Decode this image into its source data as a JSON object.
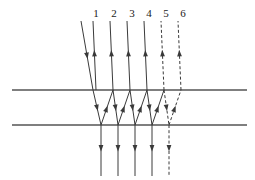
{
  "figure": {
    "title": "",
    "type": "optical-ray-diagram",
    "width": 255,
    "height": 180,
    "background": "#ffffff",
    "ink_color": "#3a3a3a",
    "label_color": "#1a1a1a",
    "line_width": 1.0
  },
  "surfaces": {
    "name": "plane-parallel-plate",
    "stroke": "#555555",
    "stroke_width": 1.6,
    "x_start": 12,
    "x_end": 247,
    "top_y": 90,
    "bottom_y": 125
  },
  "labels": {
    "items": [
      {
        "text": "1",
        "x": 96,
        "y": 17
      },
      {
        "text": "2",
        "x": 114,
        "y": 17
      },
      {
        "text": "3",
        "x": 132,
        "y": 17
      },
      {
        "text": "4",
        "x": 149,
        "y": 17
      },
      {
        "text": "5",
        "x": 166,
        "y": 17
      },
      {
        "text": "6",
        "x": 183,
        "y": 17
      }
    ]
  },
  "incident_ray": {
    "name": "incident-ray",
    "x1": 81,
    "y1": 21,
    "x2": 93,
    "y2": 90,
    "dashed": false,
    "arrow_t": 0.55,
    "direction": "down"
  },
  "reflected_rays": [
    {
      "label": "1",
      "x1": 96,
      "y1": 90,
      "x2": 93,
      "y2": 21,
      "dashed": false,
      "arrow_t": 0.58
    },
    {
      "label": "2",
      "x1": 113,
      "y1": 90,
      "x2": 110,
      "y2": 21,
      "dashed": false,
      "arrow_t": 0.58
    },
    {
      "label": "3",
      "x1": 130,
      "y1": 90,
      "x2": 127,
      "y2": 21,
      "dashed": false,
      "arrow_t": 0.58
    },
    {
      "label": "4",
      "x1": 147,
      "y1": 90,
      "x2": 144,
      "y2": 21,
      "dashed": false,
      "arrow_t": 0.58
    },
    {
      "label": "5",
      "x1": 164,
      "y1": 90,
      "x2": 161,
      "y2": 21,
      "dashed": true,
      "arrow_t": 0.58
    },
    {
      "label": "6",
      "x1": 181,
      "y1": 90,
      "x2": 178,
      "y2": 21,
      "dashed": true,
      "arrow_t": 0.58
    }
  ],
  "internal_rays": [
    {
      "x1": 93,
      "y1": 90,
      "x2": 101,
      "y2": 125,
      "dashed": false,
      "arrow_t": 0.6,
      "segment": "down-1"
    },
    {
      "x1": 101,
      "y1": 125,
      "x2": 113,
      "y2": 90,
      "dashed": false,
      "arrow_t": 0.55,
      "segment": "up-1"
    },
    {
      "x1": 113,
      "y1": 90,
      "x2": 118,
      "y2": 125,
      "dashed": false,
      "arrow_t": 0.6,
      "segment": "down-2"
    },
    {
      "x1": 118,
      "y1": 125,
      "x2": 130,
      "y2": 90,
      "dashed": false,
      "arrow_t": 0.55,
      "segment": "up-2"
    },
    {
      "x1": 130,
      "y1": 90,
      "x2": 135,
      "y2": 125,
      "dashed": false,
      "arrow_t": 0.6,
      "segment": "down-3"
    },
    {
      "x1": 135,
      "y1": 125,
      "x2": 147,
      "y2": 90,
      "dashed": false,
      "arrow_t": 0.55,
      "segment": "up-3"
    },
    {
      "x1": 147,
      "y1": 90,
      "x2": 152,
      "y2": 125,
      "dashed": false,
      "arrow_t": 0.6,
      "segment": "down-4"
    },
    {
      "x1": 152,
      "y1": 125,
      "x2": 164,
      "y2": 90,
      "dashed": false,
      "arrow_t": 0.55,
      "segment": "up-4"
    },
    {
      "x1": 164,
      "y1": 90,
      "x2": 169,
      "y2": 125,
      "dashed": true,
      "arrow_t": 0.6,
      "segment": "down-5"
    },
    {
      "x1": 169,
      "y1": 125,
      "x2": 181,
      "y2": 90,
      "dashed": true,
      "arrow_t": 0.55,
      "segment": "up-5"
    }
  ],
  "transmitted_rays": [
    {
      "x1": 101,
      "y1": 125,
      "x2": 101,
      "y2": 176,
      "dashed": false,
      "arrow_t": 0.52
    },
    {
      "x1": 118,
      "y1": 125,
      "x2": 118,
      "y2": 176,
      "dashed": false,
      "arrow_t": 0.52
    },
    {
      "x1": 135,
      "y1": 125,
      "x2": 135,
      "y2": 176,
      "dashed": false,
      "arrow_t": 0.52
    },
    {
      "x1": 152,
      "y1": 125,
      "x2": 152,
      "y2": 176,
      "dashed": false,
      "arrow_t": 0.52
    },
    {
      "x1": 169,
      "y1": 125,
      "x2": 169,
      "y2": 176,
      "dashed": true,
      "arrow_t": 0.52
    }
  ],
  "arrow": {
    "length": 6.5,
    "half_width": 2.4
  },
  "dash_pattern": "3,2.2"
}
